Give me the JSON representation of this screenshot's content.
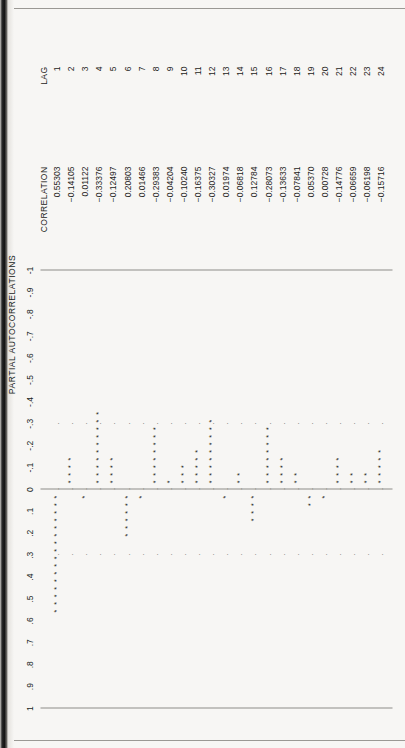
{
  "document": {
    "kind": "scanned-statistical-printout",
    "orientation": "landscape-printed-on-portrait-page",
    "rotation_degrees": -90
  },
  "chart_data": {
    "type": "bar",
    "title": "PARTIAL AUTOCORRELATIONS",
    "xlabel": "LAG",
    "ylabel": "PARTIAL AUTOCORRELATIONS",
    "ylim": [
      -1,
      1
    ],
    "grid": false,
    "legend": null,
    "axis_tick_labels": [
      "1",
      ".9",
      ".8",
      ".7",
      ".6",
      ".5",
      ".4",
      ".3",
      ".2",
      ".1",
      "0",
      "-.1",
      "-.2",
      "-.3",
      "-.4",
      "-.5",
      "-.6",
      "-.7",
      "-.8",
      "-.9",
      "-1"
    ],
    "axis_tick_values": [
      1,
      0.9,
      0.8,
      0.7,
      0.6,
      0.5,
      0.4,
      0.3,
      0.2,
      0.1,
      0,
      -0.1,
      -0.2,
      -0.3,
      -0.4,
      -0.5,
      -0.6,
      -0.7,
      -0.8,
      -0.9,
      -1
    ],
    "categories": [
      1,
      2,
      3,
      4,
      5,
      6,
      7,
      8,
      9,
      10,
      11,
      12,
      13,
      14,
      15,
      16,
      17,
      18,
      19,
      20,
      21,
      22,
      23,
      24
    ],
    "values": [
      0.55303,
      -0.14105,
      0.01122,
      -0.33376,
      -0.12497,
      0.20803,
      0.01466,
      -0.29383,
      -0.04204,
      -0.1024,
      -0.16375,
      -0.30327,
      0.01974,
      -0.06818,
      0.12784,
      -0.28073,
      -0.13633,
      -0.07841,
      0.0537,
      0.00728,
      -0.14776,
      -0.06659,
      -0.06198,
      -0.15716
    ],
    "reference_lines": [
      1,
      0,
      -1
    ],
    "marker": "*"
  },
  "table": {
    "headers": {
      "lag": "LAG",
      "correlation": "CORRELATION"
    },
    "rows": [
      {
        "lag": "1",
        "correlation": "0.55303"
      },
      {
        "lag": "2",
        "correlation": "-0.14105"
      },
      {
        "lag": "3",
        "correlation": "0.01122"
      },
      {
        "lag": "4",
        "correlation": "-0.33376"
      },
      {
        "lag": "5",
        "correlation": "-0.12497"
      },
      {
        "lag": "6",
        "correlation": "0.20803"
      },
      {
        "lag": "7",
        "correlation": "0.01466"
      },
      {
        "lag": "8",
        "correlation": "-0.29383"
      },
      {
        "lag": "9",
        "correlation": "-0.04204"
      },
      {
        "lag": "10",
        "correlation": "-0.10240"
      },
      {
        "lag": "11",
        "correlation": "-0.16375"
      },
      {
        "lag": "12",
        "correlation": "-0.30327"
      },
      {
        "lag": "13",
        "correlation": "0.01974"
      },
      {
        "lag": "14",
        "correlation": "-0.06818"
      },
      {
        "lag": "15",
        "correlation": "0.12784"
      },
      {
        "lag": "16",
        "correlation": "-0.28073"
      },
      {
        "lag": "17",
        "correlation": "-0.13633"
      },
      {
        "lag": "18",
        "correlation": "-0.07841"
      },
      {
        "lag": "19",
        "correlation": "0.05370"
      },
      {
        "lag": "20",
        "correlation": "0.00728"
      },
      {
        "lag": "21",
        "correlation": "-0.14776"
      },
      {
        "lag": "22",
        "correlation": "-0.06659"
      },
      {
        "lag": "23",
        "correlation": "-0.06198"
      },
      {
        "lag": "24",
        "correlation": "-0.15716"
      }
    ]
  },
  "colors": {
    "paper": "#f7f6f4",
    "ink": "#1d1c1a",
    "rule": "#8d8b87",
    "scan_edge": "#111111"
  }
}
